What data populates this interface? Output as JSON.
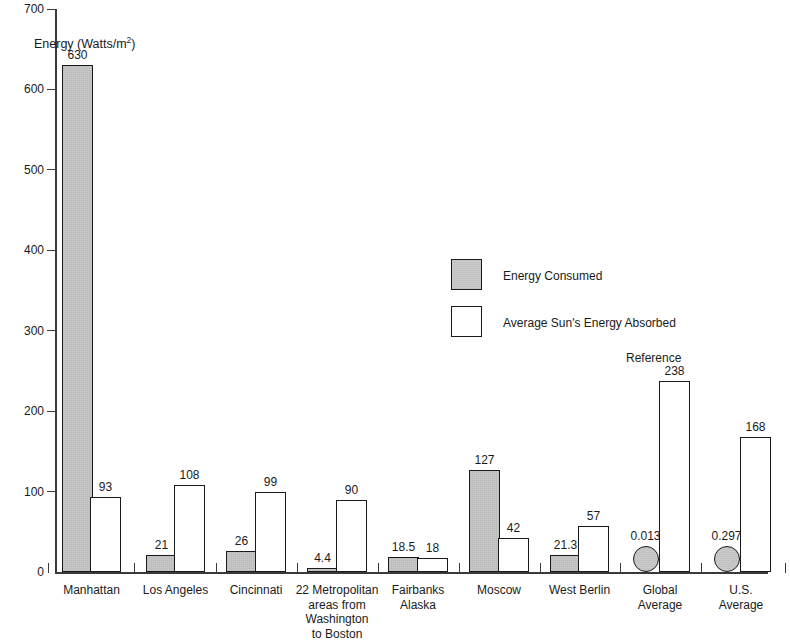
{
  "chart_data": {
    "type": "bar",
    "title": "",
    "subtitle": "",
    "xlabel": "",
    "ylabel": "Energy (Watts/m",
    "ylabel_sup": "2",
    "ylabel_tail": ")",
    "ylim": [
      0,
      700
    ],
    "y_ticks": [
      0,
      100,
      200,
      300,
      400,
      500,
      600,
      700
    ],
    "y_tick_labels": [
      "0",
      "100",
      "200",
      "300",
      "400",
      "500",
      "600",
      "700"
    ],
    "grid": false,
    "legend_position": "center",
    "categories": [
      "Manhattan",
      "Los Angeles",
      "Cincinnati",
      "22 Metropolitan areas from Washington to Boston",
      "Fairbanks Alaska",
      "Moscow",
      "West Berlin",
      "Global Average",
      "U.S. Average"
    ],
    "series": [
      {
        "name": "Energy Consumed",
        "values": [
          630,
          21,
          26,
          4.4,
          18.5,
          127,
          21.3,
          0.013,
          0.297
        ],
        "value_labels": [
          "630",
          "21",
          "26",
          "4.4",
          "18.5",
          "127",
          "21.3",
          "0.013",
          "0.297"
        ],
        "color": "#c9c9c9"
      },
      {
        "name": "Average Sun's Energy Absorbed",
        "values": [
          93,
          108,
          99,
          90,
          18,
          42,
          57,
          238,
          168
        ],
        "value_labels": [
          "93",
          "108",
          "99",
          "90",
          "18",
          "42",
          "57",
          "238",
          "168"
        ],
        "color": "#ffffff"
      }
    ],
    "annotations": [
      {
        "text": "Reference",
        "near": "Global Average"
      }
    ],
    "marker_note": "Global Average and U.S. Average energy-consumed values are drawn as circle markers on the baseline because the values are near zero."
  },
  "axis": {
    "y_title_main": "Energy (Watts/m",
    "y_title_sup": "2",
    "y_title_tail": ")"
  },
  "legend": {
    "items": [
      {
        "label": "Energy Consumed",
        "swatch": "consumed"
      },
      {
        "label": "Average Sun's Energy Absorbed",
        "swatch": "absorbed"
      }
    ]
  },
  "annotations": {
    "reference": "Reference"
  },
  "category_labels": [
    {
      "lines": [
        "Manhattan"
      ]
    },
    {
      "lines": [
        "Los Angeles"
      ]
    },
    {
      "lines": [
        "Cincinnati"
      ]
    },
    {
      "lines": [
        "22 Metropolitan",
        "areas from",
        "Washington",
        "to Boston"
      ]
    },
    {
      "lines": [
        "Fairbanks",
        "Alaska"
      ]
    },
    {
      "lines": [
        "Moscow"
      ]
    },
    {
      "lines": [
        "West Berlin"
      ]
    },
    {
      "lines": [
        "Global",
        "Average"
      ]
    },
    {
      "lines": [
        "U.S.",
        "Average"
      ]
    }
  ],
  "colors": {
    "consumed_fill": "#c9c9c9",
    "absorbed_fill": "#ffffff",
    "stroke": "#1a1a1a",
    "axis": "#3a3a3a",
    "background": "#ffffff"
  }
}
